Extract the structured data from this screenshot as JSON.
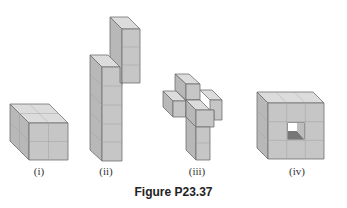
{
  "figure": {
    "caption": "Figure P23.37",
    "panels": [
      {
        "id": "i",
        "label": "(i)",
        "description": "2x2x2 cube"
      },
      {
        "id": "ii",
        "label": "(ii)",
        "description": "tall L-shaped stack of cubes"
      },
      {
        "id": "iii",
        "label": "(iii)",
        "description": "3D cross of cubes"
      },
      {
        "id": "iv",
        "label": "(iv)",
        "description": "3x3x3 cube with hollow center tunnel"
      }
    ]
  },
  "colors": {
    "front": "#c4c4c4",
    "top": "#dcdcdc",
    "side": "#b0b0b0",
    "edge": "#6e6e6e",
    "grid": "#9a9a9a",
    "hole_light": "#ffffff",
    "hole_dark": "#777777"
  }
}
